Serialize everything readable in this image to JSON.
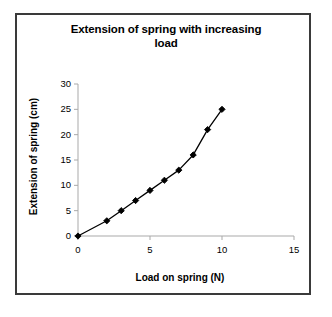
{
  "figure": {
    "background_color": "#ffffff",
    "border_color": "#3a3a3a",
    "axis_color": "#a9a9a9",
    "series_color": "#000000"
  },
  "chart_data": {
    "type": "line",
    "title": "Extension of spring with increasing load",
    "title_line1": "Extension of spring with increasing",
    "title_line2": "load",
    "xlabel": "Load on spring (N)",
    "ylabel": "Extension of spring (cm)",
    "xlim": [
      0,
      15
    ],
    "ylim": [
      0,
      30
    ],
    "xticks": [
      0,
      5,
      10,
      15
    ],
    "yticks": [
      0,
      5,
      10,
      15,
      20,
      25,
      30
    ],
    "xtick_labels": [
      "0",
      "5",
      "10",
      "15"
    ],
    "ytick_labels": [
      "0",
      "5",
      "10",
      "15",
      "20",
      "25",
      "30"
    ],
    "grid": false,
    "legend": false,
    "marker": "diamond",
    "x": [
      0,
      2,
      3,
      4,
      5,
      6,
      7,
      8,
      9,
      10
    ],
    "y": [
      0,
      3,
      5,
      7,
      9,
      11,
      13,
      16,
      21,
      25
    ],
    "points": [
      {
        "x": 0,
        "y": 0
      },
      {
        "x": 2,
        "y": 3
      },
      {
        "x": 3,
        "y": 5
      },
      {
        "x": 4,
        "y": 7
      },
      {
        "x": 5,
        "y": 9
      },
      {
        "x": 6,
        "y": 11
      },
      {
        "x": 7,
        "y": 13
      },
      {
        "x": 8,
        "y": 16
      },
      {
        "x": 9,
        "y": 21
      },
      {
        "x": 10,
        "y": 25
      }
    ]
  }
}
